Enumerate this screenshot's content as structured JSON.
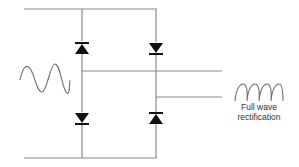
{
  "diagram": {
    "input_label": "",
    "output_label_line1": "Full wave",
    "output_label_line2": "rectification",
    "colors": {
      "wire": "#8a8a8a",
      "diode": "#111111",
      "wave": "#6e6e6e",
      "text": "#333333"
    },
    "components": [
      {
        "id": "D1",
        "type": "diode",
        "position": "top-left",
        "orientation": "up"
      },
      {
        "id": "D2",
        "type": "diode",
        "position": "top-right",
        "orientation": "down"
      },
      {
        "id": "D3",
        "type": "diode",
        "position": "bottom-left",
        "orientation": "down"
      },
      {
        "id": "D4",
        "type": "diode",
        "position": "bottom-right",
        "orientation": "up"
      }
    ],
    "input_signal": "sine-wave",
    "output_signal": "full-wave-rectified"
  }
}
